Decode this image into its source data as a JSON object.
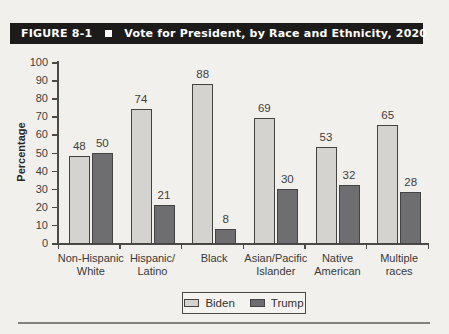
{
  "figure": {
    "label": "FIGURE 8-1",
    "title": "Vote for President, by Race and Ethnicity, 2020"
  },
  "chart_data": {
    "type": "bar",
    "title": "Vote for President, by Race and Ethnicity, 2020",
    "categories": [
      "Non-Hispanic\nWhite",
      "Hispanic/\nLatino",
      "Black",
      "Asian/Pacific\nIslander",
      "Native\nAmerican",
      "Multiple\nraces"
    ],
    "series": [
      {
        "name": "Biden",
        "values": [
          48,
          74,
          88,
          69,
          53,
          65
        ],
        "color": "#d4d3d0"
      },
      {
        "name": "Trump",
        "values": [
          50,
          21,
          8,
          30,
          32,
          28
        ],
        "color": "#6e6e71"
      }
    ],
    "xlabel": "",
    "ylabel": "Percentage",
    "ylim": [
      0,
      100
    ],
    "ytick_step": 10,
    "grid": false,
    "legend_position": "bottom",
    "value_labels": true
  },
  "colors": {
    "titlebar_bg": "#1d1b19",
    "titlebar_text": "#ffffff",
    "biden_bar": "#d4d3d0",
    "trump_bar": "#6e6e71",
    "axis": "#4a4a48"
  }
}
